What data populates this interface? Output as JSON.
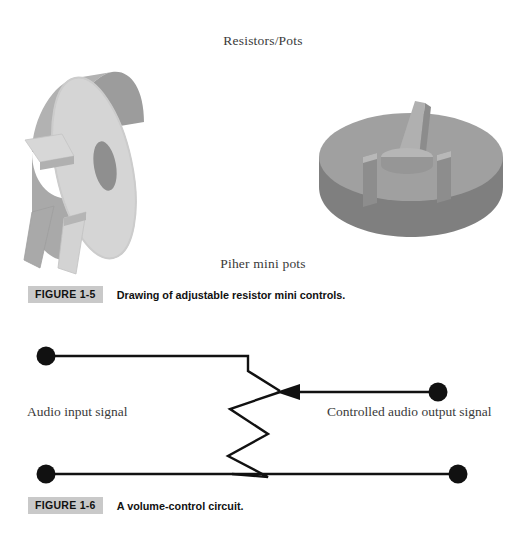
{
  "page": {
    "background_color": "#ffffff",
    "width": 526,
    "height": 536
  },
  "section_title": "Resistors/Pots",
  "photo_label": "Piher mini pots",
  "figures": [
    {
      "id": "figure-1-5",
      "badge": "FIGURE 1-5",
      "caption": "Drawing of adjustable resistor mini controls.",
      "badge_bg": "#c9c9c9"
    },
    {
      "id": "figure-1-6",
      "badge": "FIGURE 1-6",
      "caption": "A volume-control circuit.",
      "badge_bg": "#c9c9c9"
    }
  ],
  "drawings": {
    "pot_left": {
      "name": "vertical-mount-mini-potentiometer",
      "body_face_color": "#d2d2d2",
      "body_rim_color": "#a6a6a6",
      "hole_color": "#8e8e8e",
      "lead_color": "#cfcfcf",
      "lead_shadow_color": "#9a9a9a"
    },
    "pot_right": {
      "name": "horizontal-mount-mini-potentiometer",
      "top_face_color": "#9f9f9f",
      "side_color": "#808080",
      "tab_color": "#aaaaaa",
      "tab_shadow_color": "#8a8a8a",
      "slot_color": "#b4b4b4"
    }
  },
  "circuit": {
    "title": "volume-control-circuit",
    "line_color": "#111111",
    "terminal_color": "#111111",
    "input_label": "Audio input signal",
    "output_label": "Controlled audio output signal",
    "terminals": [
      {
        "name": "input-top-terminal",
        "cx": 46,
        "cy": 356
      },
      {
        "name": "input-bottom-terminal",
        "cx": 46,
        "cy": 474
      },
      {
        "name": "output-terminal",
        "cx": 438,
        "cy": 393
      },
      {
        "name": "ground-right-terminal",
        "cx": 458,
        "cy": 474
      }
    ],
    "components": [
      {
        "name": "resistor-zigzag",
        "type": "potentiometer-element"
      },
      {
        "name": "wiper-arrow",
        "type": "arrow-left"
      }
    ]
  }
}
